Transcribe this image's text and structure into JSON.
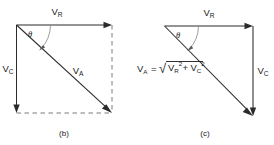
{
  "figure": {
    "background_color": "#ffffff",
    "line_color": "#2b2b2b",
    "dashed_color": "#7a7a7a",
    "text_color": "#1a1a1a",
    "width": 274,
    "height": 145
  },
  "panel_b": {
    "caption": "(b)",
    "angle_symbol": "θ",
    "vectors": [
      {
        "key": "vr",
        "base": "V",
        "subscript": "R",
        "label": "V_R",
        "direction": "right",
        "style": "solid"
      },
      {
        "key": "vc",
        "base": "V",
        "subscript": "C",
        "label": "V_C",
        "direction": "down",
        "style": "solid"
      },
      {
        "key": "va",
        "base": "V",
        "subscript": "A",
        "label": "V_A",
        "direction": "down-right-diagonal",
        "style": "solid"
      }
    ],
    "construction_lines": [
      {
        "key": "right-dashed",
        "orientation": "vertical",
        "style": "dashed"
      },
      {
        "key": "bottom-dashed",
        "orientation": "horizontal",
        "style": "dashed"
      }
    ]
  },
  "panel_c": {
    "caption": "(c)",
    "angle_symbol": "θ",
    "vectors": [
      {
        "key": "vr",
        "base": "V",
        "subscript": "R",
        "label": "V_R",
        "direction": "right",
        "style": "solid"
      },
      {
        "key": "vc",
        "base": "V",
        "subscript": "C",
        "label": "V_C",
        "direction": "down",
        "style": "solid"
      },
      {
        "key": "va",
        "base": "V",
        "subscript": "A",
        "label": "V_A",
        "direction": "down-right-diagonal",
        "style": "solid"
      }
    ],
    "formula": {
      "plain": "V_A = sqrt(V_R^2 + V_C^2)",
      "lhs_base": "V",
      "lhs_sub": "A",
      "equals": "=",
      "radical": "√",
      "term1_base": "V",
      "term1_sub": "R",
      "term1_sup": "2",
      "plus": "+",
      "term2_base": "V",
      "term2_sub": "C",
      "term2_sup": "2"
    }
  }
}
